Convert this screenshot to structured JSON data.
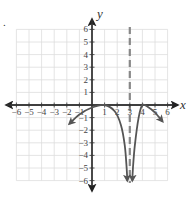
{
  "chart_data": {
    "type": "line",
    "title": "",
    "xlabel": "x",
    "ylabel": "y",
    "xlim": [
      -6,
      6
    ],
    "ylim": [
      -6,
      6
    ],
    "grid": true,
    "x_ticks": [
      -6,
      -5,
      -4,
      -3,
      -2,
      -1,
      1,
      2,
      3,
      4,
      5,
      6
    ],
    "y_ticks": [
      6,
      5,
      4,
      3,
      2,
      1,
      -1,
      -2,
      -3,
      -4,
      -5,
      -6
    ],
    "x_tick_labels": [
      "−6",
      "−5",
      "−4",
      "−3",
      "−2",
      "−1",
      "1",
      "2",
      "3",
      "4",
      "5",
      "6"
    ],
    "y_tick_labels": [
      "6",
      "5",
      "4",
      "3",
      "2",
      "1",
      "−1",
      "−2",
      "−3",
      "−4",
      "−5",
      "−6"
    ],
    "asymptotes": [
      {
        "type": "vertical",
        "x": 3,
        "style": "dashed"
      }
    ],
    "series": [
      {
        "name": "left branch",
        "points": [
          [
            -1.8,
            -1.5
          ],
          [
            -1,
            -0.75
          ],
          [
            0,
            -0.2
          ],
          [
            1,
            0
          ],
          [
            1.8,
            -0.5
          ],
          [
            2.3,
            -1.6
          ],
          [
            2.6,
            -3.2
          ],
          [
            2.75,
            -5
          ],
          [
            2.8,
            -6
          ]
        ],
        "arrows": [
          "start",
          "end"
        ]
      },
      {
        "name": "right branch",
        "points": [
          [
            3.2,
            -6
          ],
          [
            3.25,
            -5
          ],
          [
            3.4,
            -3.2
          ],
          [
            3.7,
            -1.0
          ],
          [
            4,
            0
          ],
          [
            4.5,
            -0.2
          ],
          [
            5,
            -0.6
          ],
          [
            5.6,
            -1.3
          ]
        ],
        "arrows": [
          "start",
          "end"
        ]
      }
    ],
    "colors": {
      "curve": "#555555",
      "asymptote": "#888888",
      "axis": "#333333",
      "grid": "#dddddd"
    }
  },
  "labels": {
    "x_axis": "x",
    "y_axis": "y",
    "corner_marker": "."
  }
}
